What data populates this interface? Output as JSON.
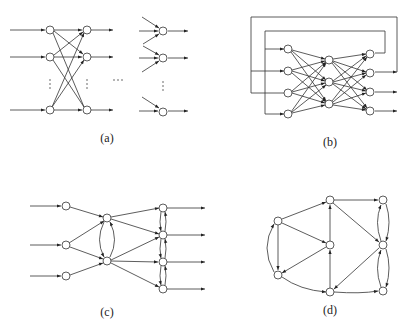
{
  "figure": {
    "panels": [
      {
        "id": "a",
        "label": "(a)",
        "type": "multilayer-feedforward-network"
      },
      {
        "id": "b",
        "label": "(b)",
        "type": "recurrent-network-with-feedback"
      },
      {
        "id": "c",
        "label": "(c)",
        "type": "network-with-lateral-connections"
      },
      {
        "id": "d",
        "label": "(d)",
        "type": "general-directed-graph"
      }
    ]
  },
  "colors": {
    "stroke": "#333333",
    "node_fill": "#ffffff",
    "background": "#ffffff"
  }
}
